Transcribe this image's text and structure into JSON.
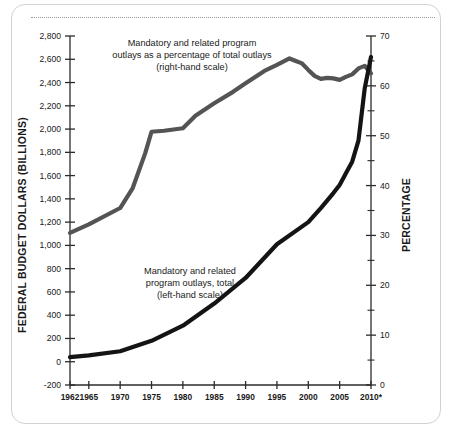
{
  "chart_data": {
    "type": "line",
    "title": "",
    "xlabel": "",
    "ylabel": "FEDERAL BUDGET DOLLARS (BILLIONS)",
    "y2label": "PERCENTAGE",
    "grid": false,
    "legend_position": "inline-annotations",
    "xlim": [
      1962,
      2010
    ],
    "ylim": [
      -200,
      2800
    ],
    "y2lim": [
      0,
      70
    ],
    "x_tick_labels": [
      "1962",
      "1965",
      "1970",
      "1975",
      "1980",
      "1985",
      "1990",
      "1995",
      "2000",
      "2005",
      "2010*"
    ],
    "x_ticks": [
      1962,
      1965,
      1970,
      1975,
      1980,
      1985,
      1990,
      1995,
      2000,
      2005,
      2010
    ],
    "y_tick_labels": [
      "2,800",
      "2,600",
      "2,400",
      "2,200",
      "2,000",
      "1,800",
      "1,600",
      "1,400",
      "1,200",
      "1,000",
      "800",
      "600",
      "400",
      "200",
      "0",
      "-200"
    ],
    "y_ticks": [
      2800,
      2600,
      2400,
      2200,
      2000,
      1800,
      1600,
      1400,
      1200,
      1000,
      800,
      600,
      400,
      200,
      0,
      -200
    ],
    "y2_tick_labels": [
      "70",
      "60",
      "50",
      "40",
      "30",
      "20",
      "10",
      "0"
    ],
    "y2_ticks": [
      70,
      60,
      50,
      40,
      30,
      20,
      10,
      0
    ],
    "y2_minor_ticks": [
      65,
      55,
      45,
      35,
      25,
      15,
      5
    ],
    "annotations": [
      {
        "name": "percentage-series-annotation",
        "lines": [
          "Mandatory and related program",
          "outlays as a percentage of total outlays",
          "(right-hand scale)"
        ]
      },
      {
        "name": "total-series-annotation",
        "lines": [
          "Mandatory and related",
          "program outlays, total",
          "(left-hand scale)"
        ]
      }
    ],
    "series": [
      {
        "name": "Mandatory and related program outlays as a percentage of total outlays",
        "axis": "right",
        "color": "#545454",
        "x": [
          1962,
          1965,
          1970,
          1972,
          1974,
          1975,
          1977,
          1980,
          1982,
          1985,
          1988,
          1990,
          1993,
          1995,
          1997,
          1998,
          1999,
          2000,
          2001,
          2002,
          2003,
          2004,
          2005,
          2006,
          2007,
          2008,
          2009,
          2010
        ],
        "values": [
          30.5,
          32.2,
          35.5,
          39.5,
          46.5,
          50.8,
          51.0,
          51.5,
          54.0,
          56.5,
          58.8,
          60.5,
          63.0,
          64.2,
          65.5,
          65.0,
          64.5,
          63.2,
          62.0,
          61.4,
          61.6,
          61.5,
          61.2,
          61.8,
          62.3,
          63.5,
          64.0,
          62.5
        ]
      },
      {
        "name": "Mandatory and related program outlays, total",
        "axis": "left",
        "color": "#141414",
        "x": [
          1962,
          1965,
          1970,
          1975,
          1980,
          1985,
          1990,
          1995,
          2000,
          2002,
          2004,
          2005,
          2006,
          2007,
          2008,
          2009,
          2010
        ],
        "values": [
          40,
          55,
          90,
          180,
          310,
          500,
          720,
          1010,
          1200,
          1320,
          1450,
          1520,
          1620,
          1720,
          1900,
          2350,
          2620
        ]
      }
    ]
  },
  "axis_titles": {
    "left": "FEDERAL BUDGET DOLLARS (BILLIONS)",
    "right": "PERCENTAGE"
  },
  "colors": {
    "percentage_line": "#545454",
    "total_line": "#141414",
    "axis": "#2b2b2b",
    "card_border": "#d2d2d2",
    "divider": "#9a9a9a"
  }
}
